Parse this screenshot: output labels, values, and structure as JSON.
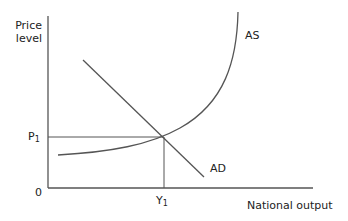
{
  "diagram": {
    "type": "AD-AS economic diagram",
    "y_axis_label_line1": "Price",
    "y_axis_label_line2": "level",
    "x_axis_label": "National output",
    "origin_label": "0",
    "price_label": "P",
    "price_sub": "1",
    "output_label": "Y",
    "output_sub": "1",
    "curves": [
      {
        "name": "AS",
        "label": "AS",
        "shape": "upward convex curve, flat then vertical"
      },
      {
        "name": "AD",
        "label": "AD",
        "shape": "downward sloping straight line"
      }
    ],
    "equilibrium": {
      "price": "P1",
      "output": "Y1"
    },
    "line_color": "#555555"
  }
}
